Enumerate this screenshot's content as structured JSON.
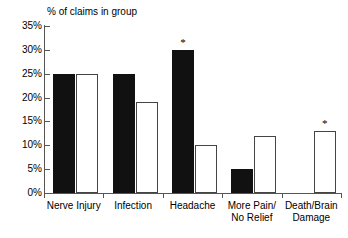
{
  "chart_data": {
    "type": "bar",
    "title": "% of claims in group",
    "xlabel": "",
    "ylabel": "",
    "ylim": [
      0,
      35
    ],
    "ytick_labels": [
      "0%",
      "5%",
      "10%",
      "15%",
      "20%",
      "25%",
      "30%",
      "35%"
    ],
    "ytick_values": [
      0,
      5,
      10,
      15,
      20,
      25,
      30,
      35
    ],
    "grid": false,
    "legend": "none",
    "categories": [
      "Nerve Injury",
      "Infection",
      "Headache",
      "More Pain/\nNo Relief",
      "Death/Brain\nDamage"
    ],
    "series": [
      {
        "name": "filled",
        "style": "filled-black",
        "values": [
          25,
          25,
          30,
          5,
          null
        ]
      },
      {
        "name": "hollow",
        "style": "white-outlined",
        "values": [
          25,
          19,
          10,
          12,
          13
        ]
      }
    ],
    "annotations": [
      {
        "marker": "*",
        "category": "Headache",
        "series": "filled",
        "value": 30
      },
      {
        "marker": "*",
        "category": "Death/Brain\nDamage",
        "series": "hollow",
        "value": 13
      }
    ]
  },
  "axis": {
    "tick_0": "0%",
    "tick_5": "5%",
    "tick_10": "10%",
    "tick_15": "15%",
    "tick_20": "20%",
    "tick_25": "25%",
    "tick_30": "30%",
    "tick_35": "35%"
  },
  "labels": {
    "cat_0": "Nerve Injury",
    "cat_1": "Infection",
    "cat_2": "Headache",
    "cat_3": "More Pain/\nNo Relief",
    "cat_4": "Death/Brain\nDamage"
  },
  "markers": {
    "star_headache": "*",
    "star_death_brain": "*"
  },
  "colors": {
    "filled_bar": "#111111",
    "hollow_bar_fill": "#ffffff",
    "hollow_bar_border": "#444444",
    "axis": "#555555",
    "text": "#000000",
    "background": "#ffffff"
  }
}
